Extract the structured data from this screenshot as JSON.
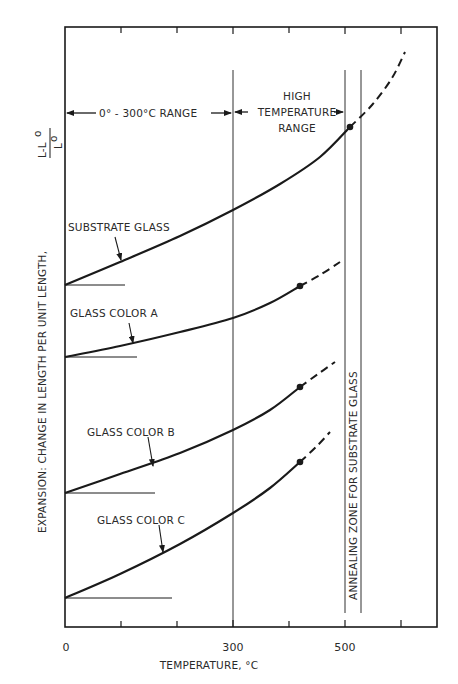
{
  "chart_data": {
    "type": "line",
    "title": "",
    "xlabel": "TEMPERATURE, °C",
    "ylabel": "EXPANSION: CHANGE IN LENGTH PER UNIT LENGTH,",
    "ylabel_fraction": {
      "numerator": "L-L",
      "numerator_sub": "o",
      "denominator": "L",
      "denominator_sub": "o"
    },
    "xlim": [
      0,
      660
    ],
    "x_ticks": [
      0,
      100,
      200,
      300,
      400,
      500,
      600
    ],
    "x_tick_labels": [
      "0",
      "300",
      "500"
    ],
    "x_tick_label_values": [
      0,
      300,
      500
    ],
    "grid": false,
    "y_axis_numeric": false,
    "note": "Curves are vertically offset; each has its own zero baseline stub.",
    "series": [
      {
        "name": "SUBSTRATE GLASS",
        "solid_points_px": [
          [
            65,
            285
          ],
          [
            120,
            262
          ],
          [
            180,
            236
          ],
          [
            233,
            210
          ],
          [
            280,
            184
          ],
          [
            320,
            157
          ],
          [
            350,
            127
          ]
        ],
        "dashed_points_px": [
          [
            350,
            127
          ],
          [
            372,
            105
          ],
          [
            392,
            78
          ],
          [
            405,
            52
          ]
        ],
        "end_dot_px": [
          350,
          127
        ],
        "baseline_px": {
          "y": 285,
          "x_end": 125
        },
        "label_pos_px": [
          68,
          227
        ],
        "arrow_px": [
          [
            115,
            237
          ],
          [
            121,
            260
          ]
        ],
        "x_solid_end_temp": 510
      },
      {
        "name": "GLASS COLOR A",
        "solid_points_px": [
          [
            65,
            357
          ],
          [
            120,
            346
          ],
          [
            180,
            332
          ],
          [
            233,
            318
          ],
          [
            270,
            303
          ],
          [
            300,
            286
          ]
        ],
        "dashed_points_px": [
          [
            300,
            286
          ],
          [
            320,
            275
          ],
          [
            340,
            262
          ]
        ],
        "end_dot_px": [
          300,
          286
        ],
        "baseline_px": {
          "y": 357,
          "x_end": 137
        },
        "label_pos_px": [
          70,
          313
        ],
        "arrow_px": [
          [
            129,
            323
          ],
          [
            133,
            343
          ]
        ],
        "x_solid_end_temp": 420
      },
      {
        "name": "GLASS COLOR B",
        "solid_points_px": [
          [
            65,
            493
          ],
          [
            120,
            474
          ],
          [
            180,
            453
          ],
          [
            233,
            430
          ],
          [
            270,
            410
          ],
          [
            300,
            387
          ]
        ],
        "dashed_points_px": [
          [
            300,
            387
          ],
          [
            318,
            374
          ],
          [
            335,
            362
          ]
        ],
        "end_dot_px": [
          300,
          387
        ],
        "baseline_px": {
          "y": 493,
          "x_end": 155
        },
        "label_pos_px": [
          87,
          432
        ],
        "arrow_px": [
          [
            148,
            437
          ],
          [
            153,
            466
          ]
        ],
        "x_solid_end_temp": 420
      },
      {
        "name": "GLASS COLOR C",
        "solid_points_px": [
          [
            65,
            598
          ],
          [
            120,
            574
          ],
          [
            180,
            544
          ],
          [
            233,
            513
          ],
          [
            270,
            488
          ],
          [
            300,
            462
          ]
        ],
        "dashed_points_px": [
          [
            300,
            462
          ],
          [
            316,
            447
          ],
          [
            330,
            432
          ]
        ],
        "end_dot_px": [
          300,
          462
        ],
        "baseline_px": {
          "y": 598,
          "x_end": 172
        },
        "label_pos_px": [
          97,
          520
        ],
        "arrow_px": [
          [
            159,
            525
          ],
          [
            163,
            552
          ]
        ],
        "x_solid_end_temp": 420
      }
    ],
    "annotations": [
      {
        "text": "0° - 300°C RANGE",
        "type": "range-arrow",
        "from": 0,
        "to": 300
      },
      {
        "text_lines": [
          "HIGH",
          "TEMPERATURE",
          "RANGE"
        ],
        "type": "range-arrow",
        "from": 300,
        "to": 500
      },
      {
        "text": "ANNEALING ZONE FOR SUBSTRATE GLASS",
        "type": "vertical-band",
        "from": 500,
        "to": 530
      }
    ],
    "reference_lines": [
      {
        "x": 300,
        "style": "solid-thin"
      },
      {
        "x": 500,
        "style": "solid-thin"
      },
      {
        "x": 530,
        "style": "solid-thin"
      }
    ]
  },
  "labels": {
    "x_tick_0": "0",
    "x_tick_300": "300",
    "x_tick_500": "500",
    "xlabel": "TEMPERATURE, °C",
    "ylabel": "EXPANSION: CHANGE IN LENGTH PER UNIT LENGTH,",
    "yfrac_num": "L-L",
    "yfrac_num_sub": "o",
    "yfrac_den": "L",
    "yfrac_den_sub": "o",
    "range_low": "0° - 300°C RANGE",
    "range_high_1": "HIGH",
    "range_high_2": "TEMPERATURE",
    "range_high_3": "RANGE",
    "annealing": "ANNEALING ZONE FOR SUBSTRATE GLASS",
    "series_substrate": "SUBSTRATE GLASS",
    "series_a": "GLASS COLOR A",
    "series_b": "GLASS COLOR B",
    "series_c": "GLASS COLOR C"
  },
  "colors": {
    "ink": "#1a1a1a",
    "background": "#ffffff"
  }
}
